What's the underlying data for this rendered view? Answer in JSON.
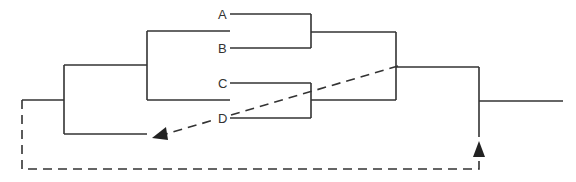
{
  "diagram": {
    "type": "tree-diagram",
    "leaves": [
      {
        "id": "A",
        "label": "A"
      },
      {
        "id": "B",
        "label": "B"
      },
      {
        "id": "C",
        "label": "C"
      },
      {
        "id": "D",
        "label": "D"
      }
    ],
    "clades": [
      {
        "name": "AB",
        "children": [
          "A",
          "B"
        ]
      },
      {
        "name": "CD",
        "children": [
          "C",
          "D"
        ]
      },
      {
        "name": "ABCD",
        "children": [
          "AB",
          "CD"
        ]
      },
      {
        "name": "inner",
        "children": [
          "ABCD",
          "unlabeled-branch"
        ]
      },
      {
        "name": "root",
        "children": [
          "inner",
          "outgroup"
        ]
      }
    ],
    "arrows": [
      {
        "name": "transfer-arrow",
        "style": "dashed",
        "from": "ABCD-node",
        "to": "unlabeled-branch"
      },
      {
        "name": "feedback-arrow",
        "style": "dashed",
        "from": "root-base",
        "to": "top-level-branch"
      }
    ],
    "colors": {
      "line": "#333333",
      "background": "#ffffff"
    }
  }
}
